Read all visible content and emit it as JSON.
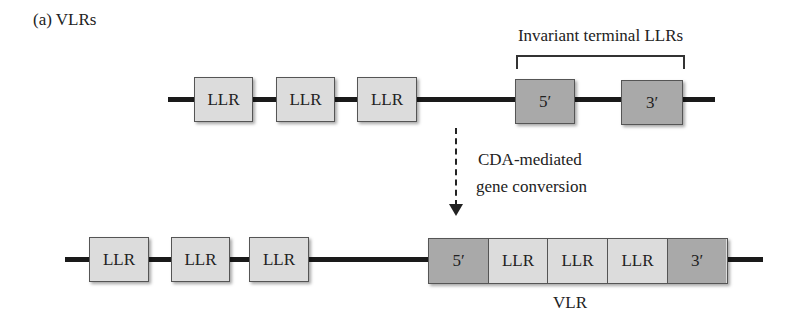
{
  "figure": {
    "panel_label": "(a) VLRs",
    "top_row": {
      "bracket_label": "Invariant terminal LLRs",
      "variable_boxes": [
        "LLR",
        "LLR",
        "LLR"
      ],
      "terminal_boxes": [
        "5′",
        "3′"
      ]
    },
    "process": {
      "line1": "CDA-mediated",
      "line2": "gene conversion"
    },
    "bottom_row": {
      "variable_boxes": [
        "LLR",
        "LLR",
        "LLR"
      ],
      "assembled_segments": [
        "5′",
        "LLR",
        "LLR",
        "LLR",
        "3′"
      ],
      "assembled_label": "VLR"
    },
    "colors": {
      "llr_fill": "#dcdcdc",
      "terminal_fill": "#a9a9a9",
      "line": "#1a1a1a"
    }
  }
}
